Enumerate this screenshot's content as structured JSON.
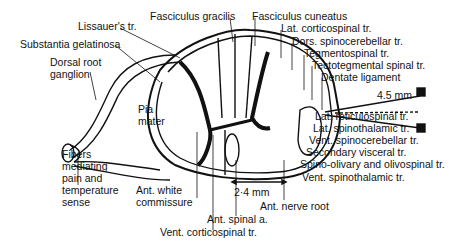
{
  "figure": {
    "labels": {
      "fasciculus_gracilis": "Fasciculus gracilis",
      "fasciculus_cuneatus": "Fasciculus cuneatus",
      "lissauers_tract": "Lissauer's tr.",
      "substantia_gelatinosa": "Substantia gelatinosa",
      "dorsal_root_ganglion": "Dorsal root\nganglion",
      "pia_mater": "Pia\nmater",
      "fibers_pain_temp": "Fibers\nmediating\npain and\ntemperature\nsense",
      "lat_corticospinal": "Lat. corticospinal tr.",
      "dors_spinocerebellar": "Dors. spinocerebellar tr.",
      "tegmentospinal": "Tegmentospinal tr.",
      "tectotegmental_spinal": "Tectotegmental spinal tr.",
      "dentate_ligament": "Dentate ligament",
      "measure_45": "4.5 mm",
      "lat_reticulospinal": "Lat. reticulospinal tr.",
      "lat_spinothalamic": "Lat. spinothalamic tr.",
      "vent_spinocerebellar": "Vent. spinocerebellar tr.",
      "secondary_visceral": "Secondary visceral tr.",
      "spino_olivary": "Spino-olivary and olivospinal tr.",
      "vent_spinothalamic": "Vent. spinothalamic tr.",
      "measure_24": "2·4 mm",
      "ant_nerve_root": "Ant. nerve root",
      "ant_white_commissure": "Ant. white\ncommissure",
      "ant_spinal_a": "Ant. spinal a.",
      "vent_corticospinal": "Vent. corticospinal tr."
    }
  }
}
